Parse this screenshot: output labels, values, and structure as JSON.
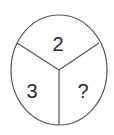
{
  "diagram": {
    "type": "circle-divided-into-three-sectors",
    "stroke_color": "#555555",
    "text_color": "#2a2a2a",
    "sectors": [
      {
        "position": "top",
        "label": "2"
      },
      {
        "position": "bottom-left",
        "label": "3"
      },
      {
        "position": "bottom-right",
        "label": "?"
      }
    ]
  }
}
